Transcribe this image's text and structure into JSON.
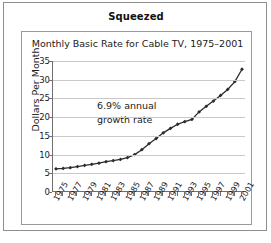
{
  "figure": {
    "title": "Squeezed"
  },
  "chart_data": {
    "type": "line",
    "title": "Monthly Basic Rate for Cable TV, 1975–2001",
    "xlabel": "",
    "ylabel": "Dollars Per Month",
    "annotation": "6.9% annual\ngrowth rate",
    "annotation_lines": [
      "6.9% annual",
      "growth rate"
    ],
    "grid": "horizontal",
    "legend": "none",
    "marker": "diamond",
    "line_color": "#2b2b2b",
    "marker_color": "#2b2b2b",
    "grid_color": "#c9c9c9",
    "axis_color": "#6f6f6f",
    "xlim": [
      1975,
      2001
    ],
    "ylim": [
      0,
      35
    ],
    "yticks": [
      0,
      5,
      10,
      15,
      20,
      25,
      30,
      35
    ],
    "ytick_labels": [
      "0",
      "5",
      "10",
      "15",
      "20",
      "25",
      "30",
      "35"
    ],
    "xticks": [
      1975,
      1976,
      1977,
      1978,
      1979,
      1980,
      1981,
      1982,
      1983,
      1984,
      1985,
      1986,
      1987,
      1988,
      1989,
      1990,
      1991,
      1992,
      1993,
      1994,
      1995,
      1996,
      1997,
      1998,
      1999,
      2000,
      2001
    ],
    "xtick_labels_shown": [
      "1975",
      "1977",
      "1979",
      "1981",
      "1983",
      "1985",
      "1987",
      "1989",
      "1991",
      "1993",
      "1995",
      "1997",
      "1999",
      "2001"
    ],
    "x": [
      1975,
      1976,
      1977,
      1978,
      1979,
      1980,
      1981,
      1982,
      1983,
      1984,
      1985,
      1986,
      1987,
      1988,
      1989,
      1990,
      1991,
      1992,
      1993,
      1994,
      1995,
      1996,
      1997,
      1998,
      1999,
      2000,
      2001
    ],
    "values": [
      6.2,
      6.3,
      6.5,
      6.8,
      7.1,
      7.4,
      7.7,
      8.1,
      8.4,
      8.7,
      9.2,
      10.0,
      11.3,
      12.9,
      14.3,
      15.8,
      17.0,
      18.1,
      18.8,
      19.4,
      21.4,
      22.9,
      24.3,
      25.8,
      27.4,
      29.5,
      32.8
    ]
  }
}
